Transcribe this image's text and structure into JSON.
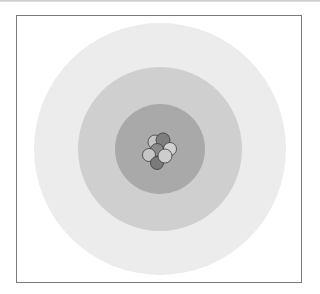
{
  "diagram": {
    "type": "atom-model",
    "center": [
      160,
      149
    ],
    "shells": [
      {
        "name": "outer-shell",
        "radius": 126,
        "color": "#ececec"
      },
      {
        "name": "middle-shell",
        "radius": 82,
        "color": "#cfcfcf"
      },
      {
        "name": "inner-shell",
        "radius": 45,
        "color": "#a9a9a9"
      }
    ],
    "nucleus": {
      "particles": [
        {
          "kind": "light",
          "cx": 155,
          "cy": 142,
          "r": 7,
          "color": "#c4c4c4"
        },
        {
          "kind": "dark",
          "cx": 163,
          "cy": 140,
          "r": 7,
          "color": "#7e7e7e"
        },
        {
          "kind": "light",
          "cx": 170,
          "cy": 149,
          "r": 6.5,
          "color": "#d2d2d2"
        },
        {
          "kind": "dark",
          "cx": 157,
          "cy": 150,
          "r": 6.5,
          "color": "#8a8a8a"
        },
        {
          "kind": "light",
          "cx": 149,
          "cy": 155,
          "r": 6.5,
          "color": "#c6c6c6"
        },
        {
          "kind": "dark",
          "cx": 157,
          "cy": 163,
          "r": 6.5,
          "color": "#7a7a7a"
        },
        {
          "kind": "light",
          "cx": 165,
          "cy": 156,
          "r": 7,
          "color": "#cdcdcd"
        }
      ],
      "stroke": "#3c3c3c"
    }
  }
}
